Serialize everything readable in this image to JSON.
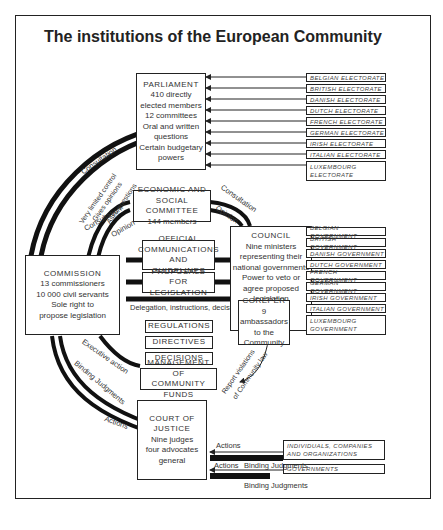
{
  "title": "The institutions of the European Community",
  "parliament": {
    "name": "PARLIAMENT",
    "lines": [
      "410 directly",
      "elected members",
      "12 committees",
      "Oral and written",
      "questions",
      "Certain budgetary",
      "powers"
    ]
  },
  "electorates": [
    "BELGIAN ELECTORATE",
    "BRITISH ELECTORATE",
    "DANISH ELECTORATE",
    "DUTCH ELECTORATE",
    "FRENCH ELECTORATE",
    "GERMAN ELECTORATE",
    "IRISH ELECTORATE",
    "ITALIAN ELECTORATE",
    "LUXEMBOURG",
    "ELECTORATE"
  ],
  "esc": {
    "line1": "ECONOMIC AND",
    "line2": "SOCIAL COMMITTEE",
    "line3": "144 members"
  },
  "commission": {
    "name": "COMMISSION",
    "lines": [
      "13 commissioners",
      "10 000 civil servants",
      "Sole right to",
      "propose legislation"
    ]
  },
  "council": {
    "name": "COUNCIL",
    "lines": [
      "Nine ministers",
      "representing their",
      "national governments",
      "Power to veto or",
      "agree proposed",
      "legislation"
    ]
  },
  "coreper": {
    "name": "COREPER",
    "lines": [
      "9 ambassadors",
      "to the",
      "Community"
    ]
  },
  "governments": [
    "BELGIAN GOVERNMENT",
    "BRITISH GOVERNMENT",
    "DANISH GOVERNMENT",
    "DUTCH GOVERNMENT",
    "FRENCH GOVERNMENT",
    "GERMAN GOVERNMENT",
    "IRISH GOVERNMENT",
    "ITALIAN GOVERNMENT",
    "LUXEMBOURG",
    "GOVERNMENT"
  ],
  "middle_boxes": {
    "official_1": "OFFICIAL",
    "official_2": "COMMUNICATIONS",
    "official_3": "AND GUIDELINES",
    "proposals_1": "PROPOSALS FOR",
    "proposals_2": "LEGISLATION",
    "regulations": "REGULATIONS",
    "directives": "DIRECTIVES",
    "decisions": "DECISIONS",
    "management_1": "MANAGEMENT OF",
    "management_2": "COMMUNITY FUNDS"
  },
  "court": {
    "name1": "COURT OF",
    "name2": "JUSTICE",
    "lines": [
      "Nine judges",
      "four advocates",
      "general"
    ]
  },
  "individuals": {
    "line1": "INDIVIDUALS, COMPANIES",
    "line2": "AND ORGANIZATIONS"
  },
  "governments_box": "GOVERNMENTS",
  "annotations": {
    "consultation_top": "Consultation",
    "very_limited": "Very limited control",
    "gives_opinions": "Gives opinions",
    "asks_questions": "Asks questions",
    "consultation_esc_left": "Consultation",
    "opinion_esc_left": "Opinion",
    "consultation_esc_right": "Consultation",
    "opinion_esc_right": "Opinion",
    "delegation": "Delegation, instructions, decisions",
    "executive_action": "Executive action",
    "binding_judgments_left": "Binding Judgments",
    "actions_left": "Actions",
    "report_violations_1": "Report violations",
    "report_violations_2": "of Community law",
    "actions_1": "Actions",
    "binding_1": "Binding Judgments",
    "actions_2": "Actions",
    "binding_2": "Binding Judgments"
  }
}
